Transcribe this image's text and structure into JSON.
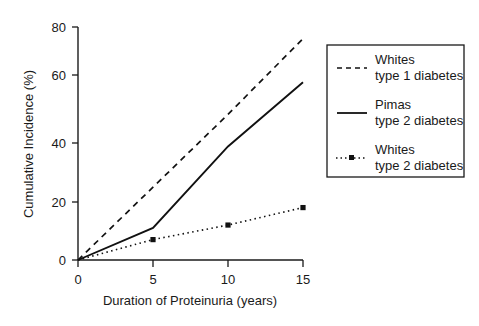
{
  "chart_data": {
    "type": "line",
    "title": "",
    "xlabel": "Duration of Proteinuria (years)",
    "ylabel": "Cumulative Incidence (%)",
    "xlim": [
      0,
      15
    ],
    "ylim": [
      0,
      80
    ],
    "xticks": [
      0,
      5,
      10,
      15
    ],
    "yticks": [
      0,
      20,
      40,
      60,
      80
    ],
    "xtick_labels": [
      "0",
      "5",
      "10",
      "15"
    ],
    "ytick_labels": [
      "0",
      "20",
      "40",
      "60",
      "80"
    ],
    "grid": false,
    "legend_position": "right-outside",
    "x": [
      0,
      5,
      10,
      15
    ],
    "series": [
      {
        "name": "Whites type 1 diabetes",
        "legend_line1": "Whites",
        "legend_line2": "type 1 diabetes",
        "style": "dashed",
        "marker": "none",
        "color": "#111111",
        "values": [
          0,
          25,
          50,
          76
        ]
      },
      {
        "name": "Pimas type 2 diabetes",
        "legend_line1": "Pimas",
        "legend_line2": "type 2 diabetes",
        "style": "solid",
        "marker": "none",
        "color": "#111111",
        "values": [
          0,
          11,
          39,
          61
        ]
      },
      {
        "name": "Whites type 2 diabetes",
        "legend_line1": "Whites",
        "legend_line2": "type 2 diabetes",
        "style": "dotted",
        "marker": "square",
        "color": "#111111",
        "values": [
          0,
          7,
          12,
          18
        ]
      }
    ]
  },
  "axes": {
    "y_title": "Cumulative Incidence (%)",
    "x_title": "Duration of Proteinuria (years)",
    "y_tick_0": "0",
    "y_tick_20": "20",
    "y_tick_40": "40",
    "y_tick_60": "60",
    "y_tick_80": "80",
    "x_tick_0": "0",
    "x_tick_5": "5",
    "x_tick_10": "10",
    "x_tick_15": "15"
  },
  "legend": {
    "entries": [
      {
        "line1": "Whites",
        "line2": "type 1 diabetes",
        "style": "dashed"
      },
      {
        "line1": "Pimas",
        "line2": "type 2 diabetes",
        "style": "solid"
      },
      {
        "line1": "Whites",
        "line2": "type 2 diabetes",
        "style": "dotted-square"
      }
    ]
  }
}
